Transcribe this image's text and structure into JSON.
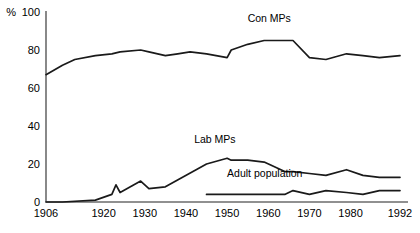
{
  "chart_data": {
    "type": "line",
    "title": "",
    "xlabel": "",
    "ylabel": "%",
    "xlim": [
      1906,
      1992
    ],
    "ylim": [
      0,
      100
    ],
    "grid": false,
    "legend_position": "inline-labels",
    "ytick_labels": [
      "0",
      "20",
      "40",
      "60",
      "80",
      "100"
    ],
    "ytick_values": [
      0,
      20,
      40,
      60,
      80,
      100
    ],
    "xtick_labels": [
      "1906",
      "1920",
      "1930",
      "1940",
      "1950",
      "1960",
      "1970",
      "1980",
      "1992"
    ],
    "xtick_values": [
      1906,
      1920,
      1930,
      1940,
      1950,
      1960,
      1970,
      1980,
      1992
    ],
    "percent_symbol": "%",
    "series": [
      {
        "name": "Con MPs",
        "label": "Con MPs",
        "label_x": 1955,
        "label_y": 95,
        "x": [
          1906,
          1910,
          1913,
          1918,
          1922,
          1924,
          1929,
          1931,
          1935,
          1938,
          1941,
          1945,
          1950,
          1951,
          1955,
          1959,
          1964,
          1966,
          1970,
          1974,
          1979,
          1983,
          1987,
          1992
        ],
        "values": [
          67,
          72,
          75,
          77,
          78,
          79,
          80,
          79,
          77,
          78,
          79,
          78,
          76,
          80,
          83,
          85,
          85,
          85,
          76,
          75,
          78,
          77,
          76,
          77
        ]
      },
      {
        "name": "Lab MPs",
        "label": "Lab MPs",
        "label_x": 1942,
        "label_y": 31,
        "x": [
          1906,
          1910,
          1918,
          1922,
          1923,
          1924,
          1929,
          1931,
          1935,
          1945,
          1950,
          1951,
          1955,
          1959,
          1964,
          1966,
          1970,
          1974,
          1979,
          1983,
          1987,
          1992
        ],
        "values": [
          0,
          0,
          1,
          4,
          9,
          5,
          11,
          7,
          8,
          20,
          23,
          22,
          22,
          21,
          16,
          16,
          15,
          14,
          17,
          14,
          13,
          13
        ]
      },
      {
        "name": "Adult population",
        "label": "Adult population",
        "label_x": 1950,
        "label_y": 13,
        "x": [
          1945,
          1950,
          1955,
          1959,
          1964,
          1966,
          1970,
          1974,
          1979,
          1983,
          1987,
          1992
        ],
        "values": [
          4,
          4,
          4,
          4,
          4,
          6,
          4,
          6,
          5,
          4,
          6,
          6
        ]
      }
    ]
  },
  "colors": {
    "line": "#1a1a1a",
    "axis": "#6b6b6b",
    "background": "#ffffff",
    "text": "#000000"
  }
}
